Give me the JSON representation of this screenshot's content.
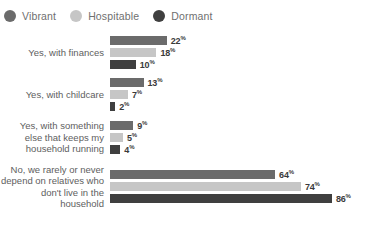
{
  "legend": {
    "items": [
      {
        "label": "Vibrant",
        "color": "#6b6b6b",
        "icon": "legend-dot-icon"
      },
      {
        "label": "Hospitable",
        "color": "#c6c6c6",
        "icon": "legend-dot-icon"
      },
      {
        "label": "Dormant",
        "color": "#3f3f3f",
        "icon": "legend-dot-icon"
      }
    ]
  },
  "chart_data": {
    "type": "bar",
    "orientation": "horizontal",
    "title": "",
    "xlabel": "",
    "ylabel": "",
    "xlim": [
      0,
      86
    ],
    "grid": false,
    "legend_position": "top-left",
    "value_suffix": "%",
    "categories": [
      "Yes, with finances",
      "Yes, with childcare",
      "Yes, with something\nelse that keeps my\nhousehold running",
      "No, we rarely or never\ndepend on relatives who\ndon't live in the household"
    ],
    "series": [
      {
        "name": "Vibrant",
        "color": "#6b6b6b",
        "values": [
          22,
          13,
          9,
          64
        ]
      },
      {
        "name": "Hospitable",
        "color": "#c6c6c6",
        "values": [
          18,
          7,
          5,
          74
        ]
      },
      {
        "name": "Dormant",
        "color": "#3f3f3f",
        "values": [
          10,
          2,
          4,
          86
        ]
      }
    ],
    "value_labels": [
      [
        "22%",
        "18%",
        "10%"
      ],
      [
        "13%",
        "7%",
        "2%"
      ],
      [
        "9%",
        "5%",
        "4%"
      ],
      [
        "64%",
        "74%",
        "86%"
      ]
    ]
  }
}
